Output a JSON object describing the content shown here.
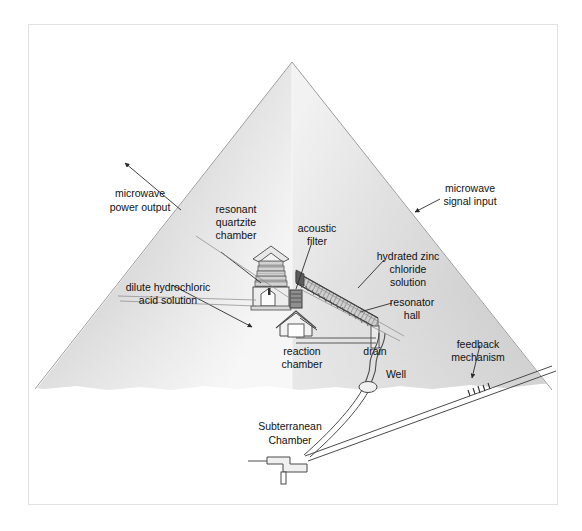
{
  "figure": {
    "background_color": "#ffffff",
    "frame_color": "#e2e2e2",
    "stone_light": "#fdfdfd",
    "stone_mid": "#d8d8d8",
    "stone_dark": "#b8b8b8",
    "line_color": "#4a4a4a",
    "text_color": "#111111"
  },
  "labels": {
    "microwave_power_output": {
      "line1": "microwave",
      "line2": "power output"
    },
    "resonant_quartzite_chamber": {
      "line1": "resonant",
      "line2": "quartzite",
      "line3": "chamber"
    },
    "acoustic_filter": {
      "line1": "acoustic",
      "line2": "filter"
    },
    "microwave_signal_input": {
      "line1": "microwave",
      "line2": "signal input"
    },
    "hydrated_zinc_chloride_solution": {
      "line1": "hydrated zinc",
      "line2": "chloride",
      "line3": "solution"
    },
    "resonator_hall": {
      "line1": "resonator",
      "line2": "hall"
    },
    "dilute_hydrochloric_acid_solution": {
      "line1": "dilute hydrochloric",
      "line2": "acid solution"
    },
    "reaction_chamber": {
      "line1": "reaction",
      "line2": "chamber"
    },
    "drain": {
      "line1": "drain"
    },
    "well": {
      "line1": "Well"
    },
    "feedback_mechanism": {
      "line1": "feedback",
      "line2": "mechanism"
    },
    "subterranean_chamber": {
      "line1": "Subterranean",
      "line2": "Chamber"
    }
  },
  "geometry": {
    "pyramid_apex": {
      "x": 292,
      "y": 62
    },
    "pyramid_base_left": {
      "x": 35,
      "y": 389
    },
    "pyramid_base_right": {
      "x": 552,
      "y": 390
    },
    "frame": {
      "x": 28,
      "y": 24,
      "width": 530,
      "height": 481
    }
  }
}
